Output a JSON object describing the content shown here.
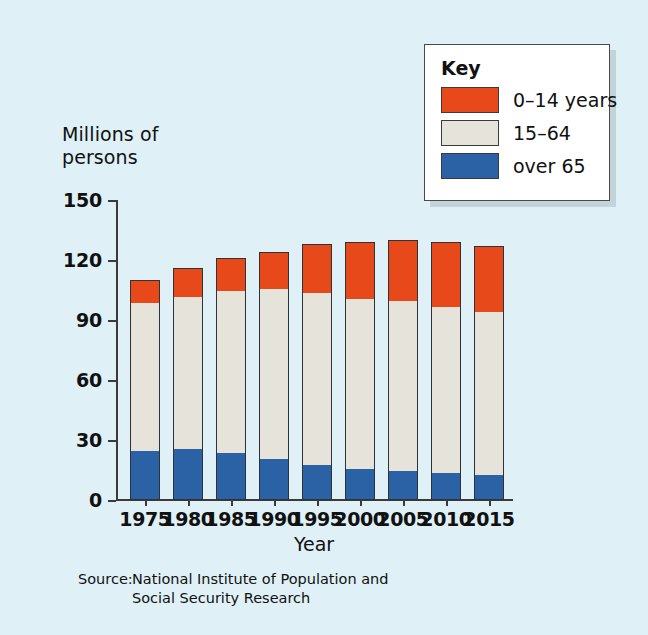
{
  "chart_data": {
    "type": "bar",
    "subtype": "stacked-bar",
    "title": "",
    "xlabel": "Year",
    "ylabel": "Millions of\npersons",
    "ylim": [
      0,
      150
    ],
    "yticks": [
      0,
      30,
      60,
      90,
      120,
      150
    ],
    "grid": false,
    "legend_position": "top-right",
    "legend_title": "Key",
    "categories": [
      "1975",
      "1980",
      "1985",
      "1990",
      "1995",
      "2000",
      "2005",
      "2010",
      "2015"
    ],
    "series": [
      {
        "name": "over 65",
        "color": "#2a62a5",
        "values": [
          24,
          25,
          23,
          20,
          17,
          15,
          14,
          13,
          12
        ]
      },
      {
        "name": "15–64",
        "color": "#e6e3da",
        "values": [
          75,
          77,
          82,
          86,
          87,
          86,
          86,
          84,
          82
        ]
      },
      {
        "name": "0–14 years",
        "color": "#e8491b",
        "values": [
          11,
          14,
          16,
          18,
          24,
          28,
          30,
          32,
          33
        ]
      }
    ],
    "totals": [
      110,
      116,
      121,
      124,
      128,
      129,
      130,
      129,
      127
    ],
    "units": "Millions of persons",
    "source": "National Institute of Population and\nSocial Security Research"
  },
  "axes": {
    "y_title": "Millions of\npersons",
    "x_title": "Year",
    "y_tick_labels": [
      "150",
      "120",
      "90",
      "60",
      "30",
      "0"
    ],
    "x_tick_labels": [
      "1975",
      "1980",
      "1985",
      "1990",
      "1995",
      "2000",
      "2005",
      "2010",
      "2015"
    ]
  },
  "legend": {
    "title": "Key",
    "items": [
      {
        "label": "0–14 years",
        "color": "#e8491b"
      },
      {
        "label": "15–64",
        "color": "#e6e3da"
      },
      {
        "label": "over 65",
        "color": "#2a62a5"
      }
    ]
  },
  "source": {
    "label": "Source:",
    "text": "National Institute of Population and\nSocial Security Research"
  },
  "colors": {
    "background": "#dff0f6",
    "axis": "#3a3a3a",
    "young": "#e8491b",
    "working": "#e6e3da",
    "old": "#2a62a5",
    "legend_background": "#ffffff"
  }
}
